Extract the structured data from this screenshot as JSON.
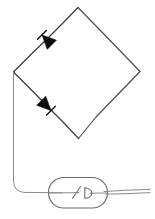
{
  "figure": {
    "kind": "circuit-schematic",
    "background_color": "#ffffff",
    "line_color": "#4a4a4a",
    "diode_fill_color": "#0d0d0d",
    "enclosure_color": "#6a6a6a",
    "width": 155,
    "height": 219
  },
  "geometry": {
    "diamond": {
      "top": [
        78,
        7
      ],
      "right": [
        140,
        72
      ],
      "bottom": [
        78,
        139
      ],
      "left": [
        13,
        72
      ]
    },
    "left_lead": {
      "from": [
        13,
        72
      ],
      "corner": [
        13,
        188
      ],
      "to": [
        62,
        193
      ]
    },
    "right_lead": {
      "from": [
        104,
        193
      ],
      "to": [
        150,
        190
      ]
    }
  },
  "components": [
    {
      "id": "diode-upper-left",
      "type": "diode",
      "label": "D1",
      "position": [
        46,
        40
      ],
      "on_edge": "top-left",
      "direction": "points-down-left",
      "angle_deg": 226
    },
    {
      "id": "diode-lower-left",
      "type": "diode",
      "label": "D2",
      "position": [
        46,
        106
      ],
      "on_edge": "bottom-left",
      "direction": "points-down-right",
      "angle_deg": 134
    },
    {
      "id": "switch-enclosure",
      "type": "enclosure",
      "label": "Stadium outline",
      "shape": "stadium",
      "bounds": [
        48,
        177,
        60,
        31
      ]
    },
    {
      "id": "switch",
      "type": "switch",
      "label": "SW1",
      "position": [
        80,
        193
      ]
    }
  ],
  "annotations": {
    "text_labels": []
  }
}
